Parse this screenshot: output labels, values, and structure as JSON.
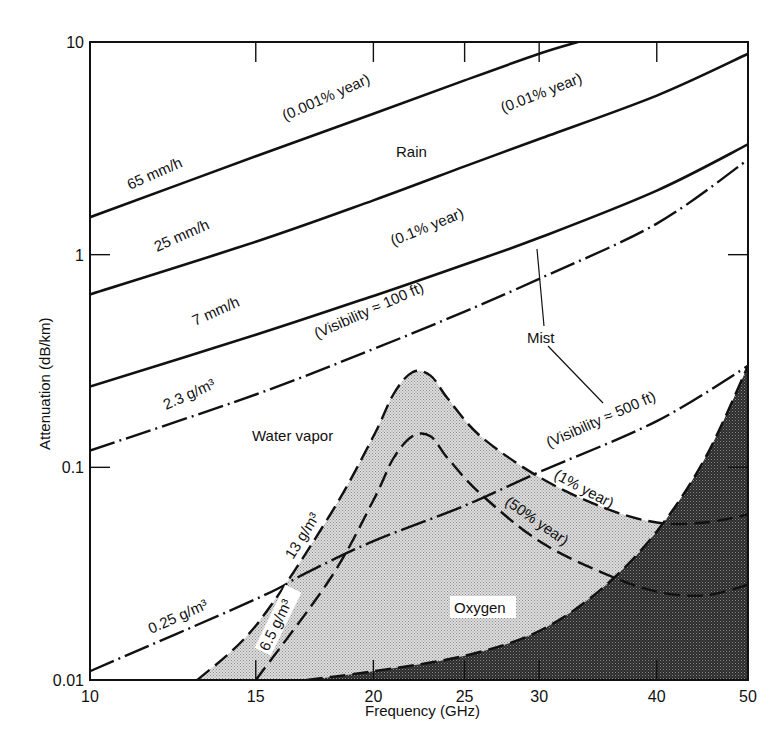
{
  "chart_data": {
    "type": "line",
    "title": "",
    "xlabel": "Frequency (GHz)",
    "ylabel": "Attenuation (dB/km)",
    "xscale": "log",
    "yscale": "log",
    "xlim": [
      10,
      50
    ],
    "ylim": [
      0.01,
      10
    ],
    "xticks": [
      10,
      15,
      20,
      25,
      30,
      40,
      50
    ],
    "xtick_labels": [
      "10",
      "15",
      "20",
      "25",
      "30",
      "40",
      "50"
    ],
    "yticks": [
      0.01,
      0.1,
      1,
      10
    ],
    "ytick_labels": [
      "0.01",
      "0.1",
      "1",
      "10"
    ],
    "grid": false,
    "series": [
      {
        "name": "Rain 65 mm/h (0.001% year)",
        "group": "Rain",
        "style": "solid",
        "x": [
          10,
          15,
          20,
          25,
          30,
          33
        ],
        "y": [
          1.5,
          2.9,
          4.6,
          6.6,
          8.8,
          10
        ]
      },
      {
        "name": "Rain 25 mm/h (0.01% year)",
        "group": "Rain",
        "style": "solid",
        "x": [
          10,
          15,
          20,
          25,
          30,
          40,
          50
        ],
        "y": [
          0.65,
          1.15,
          1.8,
          2.6,
          3.5,
          5.6,
          8.8
        ]
      },
      {
        "name": "Rain 7 mm/h (0.1% year)",
        "group": "Rain",
        "style": "solid",
        "x": [
          10,
          15,
          20,
          25,
          30,
          40,
          50
        ],
        "y": [
          0.24,
          0.42,
          0.64,
          0.9,
          1.2,
          2.0,
          3.3
        ]
      },
      {
        "name": "Mist 2.3 g/m3 (Visibility ≈ 100 ft)",
        "group": "Mist",
        "style": "dashdot",
        "x": [
          10,
          15,
          20,
          25,
          30,
          40,
          50
        ],
        "y": [
          0.12,
          0.22,
          0.36,
          0.54,
          0.77,
          1.4,
          2.8
        ]
      },
      {
        "name": "Mist 0.25 g/m3 (Visibility ≈ 500 ft)",
        "group": "Mist",
        "style": "dashdot",
        "x": [
          10,
          15,
          17,
          20,
          25,
          30,
          40,
          50
        ],
        "y": [
          0.011,
          0.024,
          0.032,
          0.045,
          0.066,
          0.095,
          0.165,
          0.3
        ]
      },
      {
        "name": "Water vapor 13 g/m3 (1% year)",
        "group": "Water vapor",
        "style": "dashed",
        "x": [
          13,
          15,
          18,
          20,
          21,
          22,
          23,
          24,
          26,
          30,
          35,
          40,
          45,
          50
        ],
        "y": [
          0.01,
          0.018,
          0.06,
          0.14,
          0.22,
          0.28,
          0.27,
          0.21,
          0.14,
          0.09,
          0.065,
          0.055,
          0.055,
          0.06
        ]
      },
      {
        "name": "Water vapor 6.5 g/m3 (50% year)",
        "group": "Water vapor",
        "style": "dashed",
        "x": [
          15,
          18,
          20,
          21,
          22,
          23,
          24,
          26,
          30,
          35,
          40,
          45,
          50
        ],
        "y": [
          0.01,
          0.03,
          0.07,
          0.11,
          0.14,
          0.14,
          0.11,
          0.075,
          0.045,
          0.032,
          0.026,
          0.025,
          0.028
        ]
      },
      {
        "name": "Oxygen",
        "group": "Oxygen",
        "style": "dashed",
        "x": [
          17,
          20,
          25,
          30,
          35,
          40,
          45,
          50
        ],
        "y": [
          0.01,
          0.011,
          0.013,
          0.017,
          0.027,
          0.05,
          0.11,
          0.3
        ]
      }
    ],
    "annotations": [
      {
        "text": "65 mm/h",
        "x": 11.5,
        "y": 2.0
      },
      {
        "text": "(0.001% year)",
        "x": 20.5,
        "y": 5.8
      },
      {
        "text": "25 mm/h",
        "x": 12.5,
        "y": 0.9
      },
      {
        "text": "Rain",
        "x": 21.7,
        "y": 2.3
      },
      {
        "text": "(0.01% year)",
        "x": 30,
        "y": 4.0
      },
      {
        "text": "7 mm/h",
        "x": 13,
        "y": 0.36
      },
      {
        "text": "(0.1% year)",
        "x": 27,
        "y": 1.1
      },
      {
        "text": "2.3 g/m³",
        "x": 12.5,
        "y": 0.17
      },
      {
        "text": "(Visibility ≈ 100 ft)",
        "x": 22,
        "y": 0.55
      },
      {
        "text": "Mist",
        "x": 34,
        "y": 0.42
      },
      {
        "text": "Water vapor",
        "x": 16.7,
        "y": 0.12
      },
      {
        "text": "(Visibility ≈ 500 ft)",
        "x": 38.5,
        "y": 0.19
      },
      {
        "text": "(1% year)",
        "x": 33,
        "y": 0.08
      },
      {
        "text": "(50% year)",
        "x": 30,
        "y": 0.055
      },
      {
        "text": "13 g/m³",
        "x": 16.5,
        "y": 0.045
      },
      {
        "text": "0.25 g/m³",
        "x": 12.5,
        "y": 0.02
      },
      {
        "text": "6.5 g/m³",
        "x": 16.3,
        "y": 0.018
      },
      {
        "text": "Oxygen",
        "x": 24.5,
        "y": 0.02
      }
    ],
    "shaded_regions": [
      {
        "name": "Water vapor region (between 13 g/m3 curve and oxygen curve)",
        "fill": "light stipple"
      },
      {
        "name": "Oxygen region (below oxygen curve)",
        "fill": "dark stipple"
      }
    ]
  },
  "labels": {
    "xlabel": "Frequency (GHz)",
    "ylabel": "Attenuation (dB/km)",
    "rain": "Rain",
    "mist": "Mist",
    "water_vapor": "Water vapor",
    "oxygen": "Oxygen",
    "r65": "65 mm/h",
    "r65p": "(0.001% year)",
    "r25": "25 mm/h",
    "r25p": "(0.01% year)",
    "r7": "7 mm/h",
    "r7p": "(0.1% year)",
    "m23": "2.3 g/m³",
    "m23v": "(Visibility ≈ 100 ft)",
    "m025": "0.25 g/m³",
    "m025v": "(Visibility ≈ 500 ft)",
    "w13": "13 g/m³",
    "w13p": "(1% year)",
    "w65": "6.5 g/m³",
    "w65p": "(50% year)"
  },
  "colors": {
    "ink": "#111111",
    "background": "#ffffff",
    "water_fill": "#cfcfcf",
    "oxygen_fill": "#3a3a3a"
  }
}
